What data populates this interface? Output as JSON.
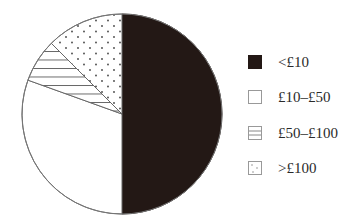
{
  "chart_data": {
    "type": "pie",
    "title": "",
    "categories": [
      "<£10",
      "£10–£50",
      "£50–£100",
      ">£100"
    ],
    "values": [
      50,
      30.5,
      7,
      12.5
    ],
    "unit": "percent (estimated from slice angles)",
    "start_angle": "12 o'clock, clockwise",
    "fills": [
      "solid-dark",
      "white",
      "horizontal-hatch",
      "dotted"
    ],
    "colors": [
      "#231815",
      "#ffffff",
      "#ffffff",
      "#ffffff"
    ],
    "legend_position": "right"
  },
  "legend": {
    "items": [
      {
        "label": "<£10",
        "fill": "solid-dark"
      },
      {
        "label": "£10–£50",
        "fill": "white"
      },
      {
        "label": "£50–£100",
        "fill": "horizontal-hatch"
      },
      {
        "label": ">£100",
        "fill": "dotted"
      }
    ]
  }
}
